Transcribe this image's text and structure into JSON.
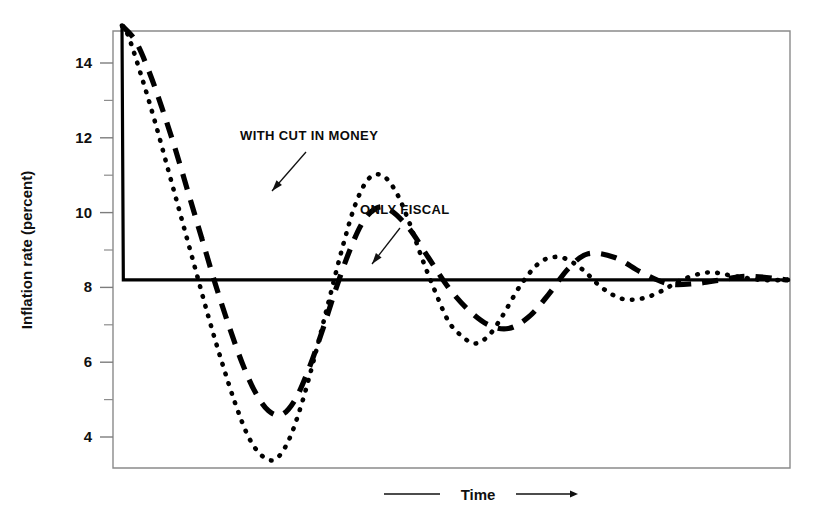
{
  "chart_data": {
    "type": "line",
    "title": "",
    "xlabel": "Time",
    "ylabel": "Inflation rate (percent)",
    "ylim": [
      3.0,
      15.2
    ],
    "xlim": [
      0,
      100
    ],
    "grid": false,
    "legend_position": "inline-annotations",
    "y_ticks_major": [
      4,
      6,
      8,
      10,
      12,
      14
    ],
    "y_ticks_minor": [
      5,
      7,
      9,
      11,
      13
    ],
    "y_tick_labels": [
      "4",
      "6",
      "8",
      "10",
      "12",
      "14"
    ],
    "x_ticks": [],
    "x_tick_labels": [],
    "steady_state": 8.2,
    "initial_rate": 15.0,
    "series": [
      {
        "name": "WITH CUT IN MONEY",
        "style": "dotted",
        "color": "#000000",
        "description": "Dotted damped oscillation with larger first amplitude",
        "x": [
          0,
          1,
          3,
          5,
          7,
          9,
          11,
          13,
          15,
          17,
          19,
          21,
          23,
          25,
          27,
          29,
          31,
          33,
          35,
          37,
          39,
          41,
          43,
          45,
          47,
          49,
          51,
          53,
          55,
          57,
          60,
          63,
          66,
          69,
          72,
          75,
          78,
          81,
          84,
          88,
          92,
          96,
          100
        ],
        "values": [
          15.0,
          14.7,
          13.6,
          12.4,
          11.1,
          9.8,
          8.5,
          7.2,
          6.0,
          4.9,
          4.0,
          3.5,
          3.4,
          3.9,
          4.9,
          6.2,
          7.6,
          9.0,
          10.2,
          10.9,
          11.0,
          10.6,
          9.8,
          8.8,
          7.9,
          7.1,
          6.7,
          6.5,
          6.7,
          7.2,
          8.1,
          8.7,
          8.8,
          8.5,
          8.0,
          7.7,
          7.7,
          7.9,
          8.2,
          8.4,
          8.3,
          8.2,
          8.2
        ]
      },
      {
        "name": "ONLY FISCAL",
        "style": "dashed",
        "color": "#000000",
        "description": "Dashed damped oscillation, lagging and smaller amplitude",
        "x": [
          0,
          2,
          4,
          6,
          8,
          10,
          12,
          14,
          16,
          18,
          20,
          22,
          24,
          26,
          28,
          30,
          32,
          34,
          36,
          38,
          40,
          43,
          46,
          49,
          52,
          55,
          58,
          61,
          64,
          67,
          70,
          74,
          78,
          82,
          86,
          90,
          94,
          100
        ],
        "values": [
          15.0,
          14.6,
          13.8,
          12.8,
          11.7,
          10.5,
          9.3,
          8.1,
          7.0,
          6.0,
          5.2,
          4.7,
          4.6,
          5.0,
          5.8,
          6.8,
          7.9,
          8.9,
          9.7,
          10.1,
          10.1,
          9.6,
          8.8,
          8.0,
          7.4,
          7.0,
          6.9,
          7.2,
          7.8,
          8.5,
          8.9,
          8.8,
          8.4,
          8.1,
          8.1,
          8.2,
          8.3,
          8.2
        ]
      },
      {
        "name": "baseline-step",
        "style": "solid",
        "color": "#000000",
        "description": "Solid step: drops instantly from 15.0 to 8.2 and stays flat",
        "x": [
          0,
          0.2,
          100
        ],
        "values": [
          15.0,
          8.2,
          8.2
        ]
      }
    ],
    "annotations": [
      {
        "text": "WITH CUT IN MONEY",
        "target_series": "WITH CUT IN MONEY",
        "label_x": 240,
        "label_y": 140,
        "arrow_from_x": 306,
        "arrow_from_y": 152,
        "arrow_to_x": 272,
        "arrow_to_y": 191
      },
      {
        "text": "ONLY FISCAL",
        "target_series": "ONLY FISCAL",
        "label_x": 360,
        "label_y": 214,
        "arrow_from_x": 400,
        "arrow_from_y": 228,
        "arrow_to_x": 372,
        "arrow_to_y": 264
      }
    ]
  },
  "axis": {
    "y_title": "Inflation rate (percent)",
    "x_title": "Time"
  }
}
